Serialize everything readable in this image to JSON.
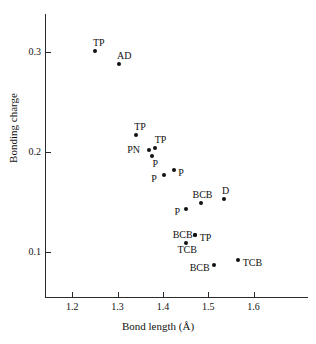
{
  "chart_data": {
    "type": "scatter",
    "title": "",
    "xlabel": "Bond length (Å)",
    "ylabel": "Bonding charge",
    "xlim": [
      1.14,
      1.72
    ],
    "ylim": [
      0.055,
      0.338
    ],
    "xticks": [
      "1.2",
      "1.3",
      "1.4",
      "1.5",
      "1.6"
    ],
    "xtick_values": [
      1.2,
      1.3,
      1.4,
      1.5,
      1.6
    ],
    "yticks": [
      "0.1",
      "0.2",
      "0.3"
    ],
    "ytick_values": [
      0.1,
      0.2,
      0.3
    ],
    "grid": false,
    "legend": "none",
    "marker": "filled-circle",
    "points": [
      {
        "label": "TP",
        "x": 1.25,
        "y": 0.301,
        "label_dx": -2,
        "label_dy": -13
      },
      {
        "label": "AD",
        "x": 1.303,
        "y": 0.288,
        "label_dx": -2,
        "label_dy": -13
      },
      {
        "label": "TP",
        "x": 1.341,
        "y": 0.217,
        "label_dx": -2,
        "label_dy": -13
      },
      {
        "label": "PN",
        "x": 1.37,
        "y": 0.202,
        "label_dx": -22,
        "label_dy": -5
      },
      {
        "label": "TP",
        "x": 1.382,
        "y": 0.204,
        "label_dx": 0,
        "label_dy": -13
      },
      {
        "label": "P",
        "x": 1.375,
        "y": 0.196,
        "label_dx": 1,
        "label_dy": 3
      },
      {
        "label": "P",
        "x": 1.403,
        "y": 0.177,
        "label_dx": -13,
        "label_dy": -1
      },
      {
        "label": "P",
        "x": 1.425,
        "y": 0.182,
        "label_dx": 4,
        "label_dy": -2
      },
      {
        "label": "BCB",
        "x": 1.483,
        "y": 0.149,
        "label_dx": -8,
        "label_dy": -13
      },
      {
        "label": "D",
        "x": 1.535,
        "y": 0.153,
        "label_dx": -2,
        "label_dy": -13
      },
      {
        "label": "P",
        "x": 1.452,
        "y": 0.143,
        "label_dx": -12,
        "label_dy": -2
      },
      {
        "label": "BCB",
        "x": 1.47,
        "y": 0.117,
        "label_dx": -22,
        "label_dy": -5
      },
      {
        "label": "TP",
        "x": 1.47,
        "y": 0.117,
        "label_dx": 5,
        "label_dy": -2
      },
      {
        "label": "TCB",
        "x": 1.452,
        "y": 0.109,
        "label_dx": -9,
        "label_dy": 2
      },
      {
        "label": "BCB",
        "x": 1.512,
        "y": 0.087,
        "label_dx": -24,
        "label_dy": -2
      },
      {
        "label": "TCB",
        "x": 1.565,
        "y": 0.092,
        "label_dx": 5,
        "label_dy": -2
      }
    ]
  }
}
